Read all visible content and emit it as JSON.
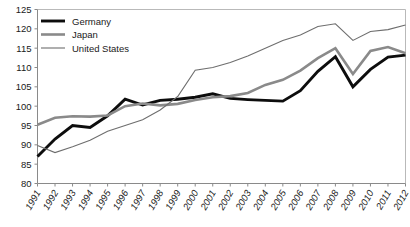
{
  "chart_data": {
    "type": "line",
    "title": "",
    "subtitle": "",
    "xlabel": "",
    "ylabel": "",
    "grid": false,
    "legend_position": "top-left",
    "ylim": [
      80,
      125
    ],
    "ytick_step": 5,
    "yticks": [
      "125",
      "120",
      "115",
      "110",
      "105",
      "100",
      "95",
      "90",
      "85",
      "80"
    ],
    "categories": [
      "1991",
      "1992",
      "1993",
      "1994",
      "1995",
      "1996",
      "1997",
      "1998",
      "1999",
      "2000",
      "2001",
      "2002",
      "2003",
      "2004",
      "2005",
      "2006",
      "2007",
      "2008",
      "2009",
      "2010",
      "2011",
      "2012"
    ],
    "series": [
      {
        "name": "Germany",
        "color": "#0d0d0d",
        "width": 2.9,
        "values": [
          87.0,
          91.5,
          95.0,
          94.5,
          97.5,
          101.8,
          100.3,
          101.5,
          101.8,
          102.3,
          103.2,
          102.0,
          101.7,
          101.5,
          101.3,
          104.0,
          109.0,
          112.8,
          105.0,
          109.5,
          112.7,
          113.2
        ]
      },
      {
        "name": "Japan",
        "color": "#8a8a8a",
        "width": 2.6,
        "values": [
          95.2,
          97.0,
          97.4,
          97.3,
          97.6,
          100.0,
          100.7,
          100.2,
          100.6,
          101.6,
          102.3,
          102.6,
          103.4,
          105.5,
          106.8,
          109.2,
          112.4,
          115.0,
          108.3,
          114.3,
          115.3,
          113.7
        ]
      },
      {
        "name": "United States",
        "color": "#6e6e6e",
        "width": 1.1,
        "values": [
          89.8,
          88.0,
          89.5,
          91.2,
          93.5,
          95.0,
          96.5,
          99.0,
          102.5,
          109.3,
          110.0,
          111.3,
          113.0,
          115.0,
          117.0,
          118.4,
          120.6,
          121.3,
          117.0,
          119.3,
          119.8,
          121.0
        ]
      }
    ]
  },
  "legend": {
    "items": [
      {
        "label": "Germany"
      },
      {
        "label": "Japan"
      },
      {
        "label": "United States"
      }
    ]
  }
}
